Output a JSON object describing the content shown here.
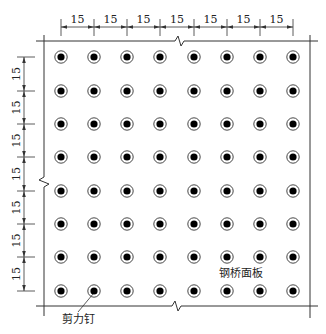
{
  "diagram": {
    "title": "",
    "labels": {
      "stud": "剪力钉",
      "deck": "钢桥面板"
    },
    "spacing": {
      "horizontal": [
        "15",
        "15",
        "15",
        "15",
        "15",
        "15",
        "15"
      ],
      "vertical": [
        "15",
        "15",
        "15",
        "15",
        "15",
        "15",
        "15"
      ]
    },
    "grid": {
      "columns": 8,
      "rows": 8,
      "col_x": [
        61,
        94,
        127,
        160,
        194,
        227,
        260,
        293
      ],
      "row_y": [
        57,
        91,
        124,
        157,
        191,
        224,
        257,
        291
      ]
    },
    "colors": {
      "line": "#333333",
      "stud_fill": "#000000",
      "background": "#ffffff"
    }
  }
}
